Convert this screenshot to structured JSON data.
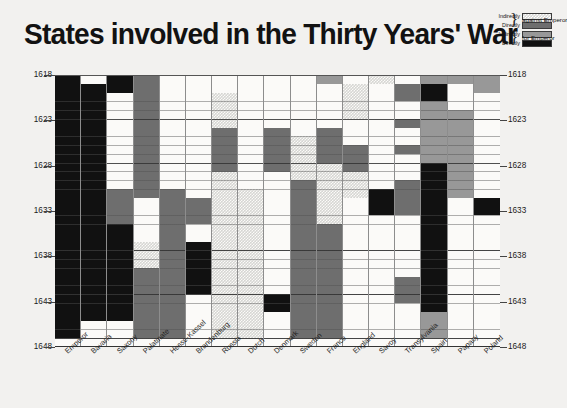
{
  "title": "States involved in the Thirty Years' War",
  "legend": {
    "rows": [
      {
        "label": "Indirectly",
        "swatch": "indirect-against"
      },
      {
        "label": "Directly",
        "swatch": "direct-against"
      },
      {
        "label": "Indirectly",
        "swatch": "indirect-for"
      },
      {
        "label": "Directly",
        "swatch": "direct-for"
      }
    ],
    "group_against": "against Emperor",
    "group_for": "for Emperor",
    "brace": "}"
  },
  "colors": {
    "indirectly_against": "#d6d6d3",
    "directly_against": "#6e6e6e",
    "indirectly_for": "#989898",
    "directly_for": "#111111",
    "background": "#f2f1ef",
    "plot_background": "#fbfaf8",
    "gridline": "#8d8d8d",
    "text": "#1a1a1a"
  },
  "axes": {
    "y_ticks_left": [
      "1618",
      "1623",
      "1628",
      "1633",
      "1638",
      "1643",
      "1648"
    ],
    "y_ticks_right": [
      "1618",
      "1623",
      "1628",
      "1633",
      "1638",
      "1643",
      "1648"
    ],
    "y_range": [
      1618,
      1648
    ],
    "y_minor_step": 1,
    "y_major_step": 5,
    "x_labels": [
      "Emperor",
      "Bavaria",
      "Saxony",
      "Palatinate",
      "Hesse-Kassel",
      "Brandenburg",
      "Russia",
      "Dutch",
      "Denmark",
      "Sweden",
      "France",
      "England",
      "Savoy",
      "Transylvania",
      "Spain",
      "Papacy",
      "Poland"
    ]
  },
  "chart_data": {
    "type": "heatmap",
    "title": "States involved in the Thirty Years' War",
    "xlabel": "",
    "ylabel": "",
    "grid": true,
    "legend_position": "top-right",
    "ylim": [
      1618,
      1648
    ],
    "x_categories": [
      "Emperor",
      "Bavaria",
      "Saxony",
      "Palatinate",
      "Hesse-Kassel",
      "Brandenburg",
      "Russia",
      "Dutch",
      "Denmark",
      "Sweden",
      "France",
      "England",
      "Savoy",
      "Transylvania",
      "Spain",
      "Papacy",
      "Poland"
    ],
    "y_categories": [
      "1618",
      "1619",
      "1620",
      "1621",
      "1622",
      "1623",
      "1624",
      "1625",
      "1626",
      "1627",
      "1628",
      "1629",
      "1630",
      "1631",
      "1632",
      "1633",
      "1634",
      "1635",
      "1636",
      "1637",
      "1638",
      "1639",
      "1640",
      "1641",
      "1642",
      "1643",
      "1644",
      "1645",
      "1646",
      "1647",
      "1648"
    ],
    "value_legend": {
      "0": "none",
      "ia": "Indirectly against Emperor",
      "da": "Directly against Emperor",
      "if": "Indirectly for Emperor",
      "df": "Directly for Emperor"
    },
    "columns": [
      {
        "name": "Emperor",
        "segments": [
          {
            "from": 1618,
            "to": 1648,
            "value": "df"
          }
        ]
      },
      {
        "name": "Bavaria",
        "segments": [
          {
            "from": 1618,
            "to": 1619,
            "value": "0"
          },
          {
            "from": 1619,
            "to": 1646,
            "value": "df"
          },
          {
            "from": 1646,
            "to": 1648,
            "value": "0"
          }
        ]
      },
      {
        "name": "Saxony",
        "segments": [
          {
            "from": 1618,
            "to": 1620,
            "value": "df"
          },
          {
            "from": 1620,
            "to": 1631,
            "value": "0"
          },
          {
            "from": 1631,
            "to": 1635,
            "value": "da"
          },
          {
            "from": 1635,
            "to": 1646,
            "value": "df"
          },
          {
            "from": 1646,
            "to": 1648,
            "value": "0"
          }
        ]
      },
      {
        "name": "Palatinate",
        "segments": [
          {
            "from": 1618,
            "to": 1632,
            "value": "da"
          },
          {
            "from": 1632,
            "to": 1637,
            "value": "0"
          },
          {
            "from": 1637,
            "to": 1640,
            "value": "ia"
          },
          {
            "from": 1640,
            "to": 1648,
            "value": "da"
          }
        ]
      },
      {
        "name": "Hesse-Kassel",
        "segments": [
          {
            "from": 1618,
            "to": 1631,
            "value": "0"
          },
          {
            "from": 1631,
            "to": 1648,
            "value": "da"
          }
        ]
      },
      {
        "name": "Brandenburg",
        "segments": [
          {
            "from": 1618,
            "to": 1632,
            "value": "0"
          },
          {
            "from": 1632,
            "to": 1635,
            "value": "da"
          },
          {
            "from": 1635,
            "to": 1637,
            "value": "0"
          },
          {
            "from": 1637,
            "to": 1643,
            "value": "df"
          },
          {
            "from": 1643,
            "to": 1648,
            "value": "0"
          }
        ]
      },
      {
        "name": "Russia",
        "segments": [
          {
            "from": 1618,
            "to": 1620,
            "value": "0"
          },
          {
            "from": 1620,
            "to": 1624,
            "value": "ia"
          },
          {
            "from": 1624,
            "to": 1629,
            "value": "da"
          },
          {
            "from": 1629,
            "to": 1648,
            "value": "ia"
          }
        ]
      },
      {
        "name": "Dutch",
        "segments": [
          {
            "from": 1618,
            "to": 1631,
            "value": "0"
          },
          {
            "from": 1631,
            "to": 1648,
            "value": "ia"
          }
        ]
      },
      {
        "name": "Denmark",
        "segments": [
          {
            "from": 1618,
            "to": 1624,
            "value": "0"
          },
          {
            "from": 1624,
            "to": 1629,
            "value": "da"
          },
          {
            "from": 1629,
            "to": 1643,
            "value": "0"
          },
          {
            "from": 1643,
            "to": 1645,
            "value": "df"
          },
          {
            "from": 1645,
            "to": 1648,
            "value": "0"
          }
        ]
      },
      {
        "name": "Sweden",
        "segments": [
          {
            "from": 1618,
            "to": 1625,
            "value": "0"
          },
          {
            "from": 1625,
            "to": 1630,
            "value": "ia"
          },
          {
            "from": 1630,
            "to": 1648,
            "value": "da"
          }
        ]
      },
      {
        "name": "France",
        "segments": [
          {
            "from": 1618,
            "to": 1619,
            "value": "if"
          },
          {
            "from": 1619,
            "to": 1624,
            "value": "0"
          },
          {
            "from": 1624,
            "to": 1628,
            "value": "da"
          },
          {
            "from": 1628,
            "to": 1631,
            "value": "ia"
          },
          {
            "from": 1631,
            "to": 1635,
            "value": "ia"
          },
          {
            "from": 1635,
            "to": 1648,
            "value": "da"
          }
        ]
      },
      {
        "name": "England",
        "segments": [
          {
            "from": 1618,
            "to": 1619,
            "value": "0"
          },
          {
            "from": 1619,
            "to": 1623,
            "value": "ia"
          },
          {
            "from": 1623,
            "to": 1626,
            "value": "0"
          },
          {
            "from": 1626,
            "to": 1629,
            "value": "da"
          },
          {
            "from": 1629,
            "to": 1632,
            "value": "ia"
          },
          {
            "from": 1632,
            "to": 1648,
            "value": "0"
          }
        ]
      },
      {
        "name": "Savoy",
        "segments": [
          {
            "from": 1618,
            "to": 1619,
            "value": "ia"
          },
          {
            "from": 1619,
            "to": 1631,
            "value": "0"
          },
          {
            "from": 1631,
            "to": 1634,
            "value": "df"
          },
          {
            "from": 1634,
            "to": 1648,
            "value": "0"
          }
        ]
      },
      {
        "name": "Transylvania",
        "segments": [
          {
            "from": 1618,
            "to": 1619,
            "value": "0"
          },
          {
            "from": 1619,
            "to": 1621,
            "value": "da"
          },
          {
            "from": 1621,
            "to": 1623,
            "value": "0"
          },
          {
            "from": 1623,
            "to": 1624,
            "value": "da"
          },
          {
            "from": 1624,
            "to": 1626,
            "value": "0"
          },
          {
            "from": 1626,
            "to": 1627,
            "value": "da"
          },
          {
            "from": 1627,
            "to": 1630,
            "value": "0"
          },
          {
            "from": 1630,
            "to": 1634,
            "value": "da"
          },
          {
            "from": 1634,
            "to": 1641,
            "value": "0"
          },
          {
            "from": 1641,
            "to": 1644,
            "value": "da"
          },
          {
            "from": 1644,
            "to": 1648,
            "value": "0"
          }
        ]
      },
      {
        "name": "Spain",
        "segments": [
          {
            "from": 1618,
            "to": 1619,
            "value": "if"
          },
          {
            "from": 1619,
            "to": 1621,
            "value": "df"
          },
          {
            "from": 1621,
            "to": 1628,
            "value": "if"
          },
          {
            "from": 1628,
            "to": 1645,
            "value": "df"
          },
          {
            "from": 1645,
            "to": 1648,
            "value": "if"
          }
        ]
      },
      {
        "name": "Papacy",
        "segments": [
          {
            "from": 1618,
            "to": 1619,
            "value": "if"
          },
          {
            "from": 1619,
            "to": 1622,
            "value": "0"
          },
          {
            "from": 1622,
            "to": 1632,
            "value": "if"
          },
          {
            "from": 1632,
            "to": 1648,
            "value": "0"
          }
        ]
      },
      {
        "name": "Poland",
        "segments": [
          {
            "from": 1618,
            "to": 1620,
            "value": "if"
          },
          {
            "from": 1620,
            "to": 1632,
            "value": "0"
          },
          {
            "from": 1632,
            "to": 1634,
            "value": "df"
          },
          {
            "from": 1634,
            "to": 1648,
            "value": "0"
          }
        ]
      }
    ]
  }
}
